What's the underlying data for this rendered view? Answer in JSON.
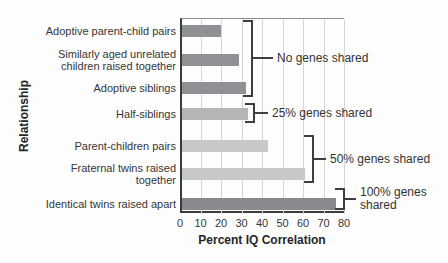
{
  "chart_data": {
    "type": "bar",
    "orientation": "horizontal",
    "xlabel": "Percent IQ Correlation",
    "ylabel": "Relationship",
    "xlim": [
      0,
      80
    ],
    "xticks": [
      0,
      10,
      20,
      30,
      40,
      50,
      60,
      70,
      80
    ],
    "grid": true,
    "categories": [
      "Adoptive parent-child pairs",
      "Similarly aged unrelated children raised together",
      "Adoptive siblings",
      "Half-siblings",
      "Parent-children pairs",
      "Fraternal twins raised together",
      "Identical twins raised apart"
    ],
    "category_lines": [
      [
        "Adoptive parent-child pairs"
      ],
      [
        "Similarly aged unrelated",
        "children raised together"
      ],
      [
        "Adoptive siblings"
      ],
      [
        "Half-siblings"
      ],
      [
        "Parent-children pairs"
      ],
      [
        "Fraternal twins raised",
        "together"
      ],
      [
        "Identical twins raised apart"
      ]
    ],
    "values": [
      19,
      28,
      31,
      32,
      42,
      60,
      75
    ],
    "bar_colors": [
      "#8f9194",
      "#8f9194",
      "#8f9194",
      "#b3b5b7",
      "#c7c8ca",
      "#c7c8ca",
      "#87898c"
    ],
    "annotations": [
      {
        "label": "No genes shared",
        "lines": [
          "No genes shared"
        ],
        "bars": [
          0,
          2
        ]
      },
      {
        "label": "25% genes shared",
        "lines": [
          "25% genes shared"
        ],
        "bars": [
          3,
          3
        ]
      },
      {
        "label": "50% genes shared",
        "lines": [
          "50% genes shared"
        ],
        "bars": [
          4,
          5
        ]
      },
      {
        "label": "100% genes shared",
        "lines": [
          "100% genes",
          "shared"
        ],
        "bars": [
          6,
          6
        ]
      }
    ],
    "colors": {
      "gridline": "#d6d6d6",
      "axis": "#3c3c3c",
      "bracket": "#3e3e3e",
      "text": "#363636",
      "background": "#fdfdfd"
    }
  }
}
